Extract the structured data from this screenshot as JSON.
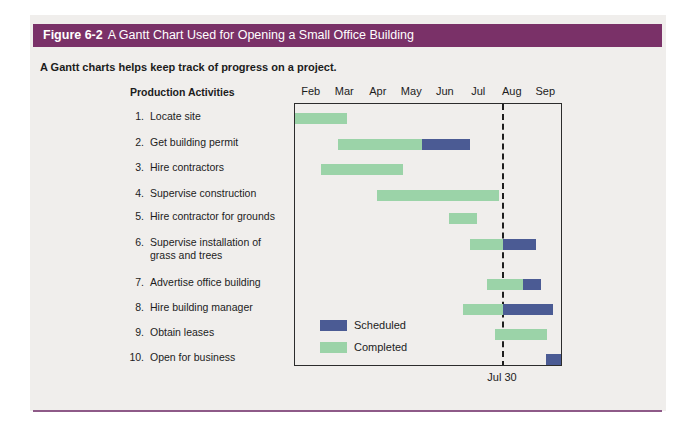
{
  "figure": {
    "label": "Figure 6-2",
    "title": "A Gantt Chart Used for Opening a Small Office Building",
    "caption": "A Gantt charts helps keep track of progress on a project.",
    "activities_heading": "Production Activities"
  },
  "legend": [
    {
      "label": "Scheduled",
      "color_key": "scheduled"
    },
    {
      "label": "Completed",
      "color_key": "completed"
    }
  ],
  "colors": {
    "header_bg": "#7a3168",
    "header_text": "#ffffff",
    "panel_bg": "#f0eeec",
    "bottom_rule": "#8e5a88",
    "scheduled": "#4b5b94",
    "completed": "#9bd3a8",
    "chart_border": "#2c2c2c"
  },
  "chart_data": {
    "type": "gantt",
    "title": "A Gantt Chart Used for Opening a Small Office Building",
    "months": [
      "Feb",
      "Mar",
      "Apr",
      "May",
      "Jun",
      "Jul",
      "Aug",
      "Sep"
    ],
    "month_axis_range": [
      0,
      8
    ],
    "today_line": {
      "position": 6.2,
      "label": "Jul 30"
    },
    "legend_entries": [
      "Scheduled",
      "Completed"
    ],
    "activities": [
      {
        "num": "1.",
        "label": "Locate site",
        "completed": [
          0.0,
          1.55
        ]
      },
      {
        "num": "2.",
        "label": "Get building permit",
        "completed": [
          1.28,
          3.79
        ],
        "scheduled": [
          3.79,
          5.22
        ]
      },
      {
        "num": "3.",
        "label": "Hire contractors",
        "completed": [
          0.78,
          3.22
        ]
      },
      {
        "num": "4.",
        "label": "Supervise construction",
        "completed": [
          2.45,
          6.09
        ]
      },
      {
        "num": "5.",
        "label": "Hire contractor for grounds",
        "completed": [
          4.6,
          5.43
        ]
      },
      {
        "num": "6.",
        "label": "Supervise installation of",
        "label2": "grass and trees",
        "completed": [
          5.22,
          6.2
        ],
        "scheduled": [
          6.2,
          7.19
        ]
      },
      {
        "num": "7.",
        "label": "Advertise office building",
        "completed": [
          5.73,
          6.81
        ],
        "scheduled": [
          6.81,
          7.34
        ]
      },
      {
        "num": "8.",
        "label": "Hire building manager",
        "completed": [
          5.01,
          6.2
        ],
        "scheduled": [
          6.2,
          7.7
        ]
      },
      {
        "num": "9.",
        "label": "Obtain leases",
        "completed": [
          5.97,
          7.52
        ]
      },
      {
        "num": "10.",
        "label": "Open for business",
        "scheduled": [
          7.49,
          8.0
        ]
      }
    ]
  }
}
